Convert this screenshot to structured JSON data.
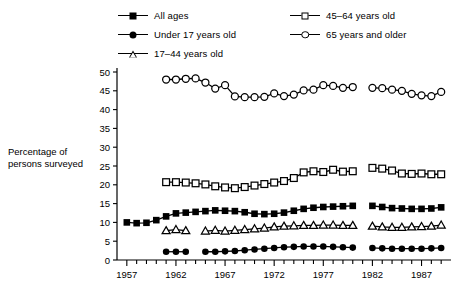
{
  "axis_title": "Percentage of persons surveyed",
  "legend": {
    "left_column": [
      {
        "label": "All ages",
        "marker": "filled-square"
      },
      {
        "label": "Under 17 years old",
        "marker": "filled-circle"
      },
      {
        "label": "17–44 years old",
        "marker": "open-triangle"
      }
    ],
    "right_column": [
      {
        "label": "45–64 years old",
        "marker": "open-square"
      },
      {
        "label": "65 years and older",
        "marker": "open-circle"
      }
    ]
  },
  "chart_data": {
    "type": "line",
    "title": "",
    "xlabel": "",
    "ylabel": "Percentage of persons surveyed",
    "xlim": [
      1956,
      1990
    ],
    "ylim": [
      0,
      50
    ],
    "ytick_step": 5,
    "yticks": [
      0,
      5,
      10,
      15,
      20,
      25,
      30,
      35,
      40,
      45,
      50
    ],
    "xticks_major": [
      1957,
      1962,
      1967,
      1972,
      1977,
      1982,
      1987
    ],
    "xticks_minor_every": 1,
    "grid": false,
    "legend_position": "top",
    "note": "Data gap between 1980 and 1982 for all series except none; all series break at 1981",
    "series": [
      {
        "name": "All ages",
        "marker": "filled-square",
        "x": [
          1957,
          1958,
          1959,
          1960,
          1961,
          1962,
          1963,
          1964,
          1965,
          1966,
          1967,
          1968,
          1969,
          1970,
          1971,
          1972,
          1973,
          1974,
          1975,
          1976,
          1977,
          1978,
          1979,
          1980,
          1982,
          1983,
          1984,
          1985,
          1986,
          1987,
          1988,
          1989
        ],
        "y": [
          10.0,
          9.8,
          9.9,
          10.6,
          11.6,
          12.4,
          12.6,
          12.8,
          13.0,
          13.2,
          13.1,
          13.0,
          12.7,
          12.3,
          12.2,
          12.3,
          12.6,
          13.1,
          13.6,
          13.9,
          14.1,
          14.2,
          14.3,
          14.4,
          14.4,
          14.1,
          13.8,
          13.7,
          13.6,
          13.6,
          13.7,
          14.0
        ]
      },
      {
        "name": "Under 17 years old",
        "marker": "filled-circle",
        "x": [
          1961,
          1962,
          1963,
          1965,
          1966,
          1967,
          1968,
          1969,
          1970,
          1971,
          1972,
          1973,
          1974,
          1975,
          1976,
          1977,
          1978,
          1979,
          1980,
          1982,
          1983,
          1984,
          1985,
          1986,
          1987,
          1988,
          1989
        ],
        "y": [
          2.2,
          2.2,
          2.2,
          2.2,
          2.2,
          2.3,
          2.4,
          2.6,
          2.8,
          3.0,
          3.2,
          3.4,
          3.5,
          3.6,
          3.6,
          3.6,
          3.5,
          3.4,
          3.3,
          3.2,
          3.1,
          3.0,
          3.0,
          3.0,
          3.0,
          3.1,
          3.2
        ]
      },
      {
        "name": "17–44 years old",
        "marker": "open-triangle",
        "x": [
          1961,
          1962,
          1963,
          1965,
          1966,
          1967,
          1968,
          1969,
          1970,
          1971,
          1972,
          1973,
          1974,
          1975,
          1976,
          1977,
          1978,
          1979,
          1980,
          1982,
          1983,
          1984,
          1985,
          1986,
          1987,
          1988,
          1989
        ],
        "y": [
          7.8,
          8.1,
          7.8,
          7.7,
          7.9,
          7.7,
          7.9,
          8.1,
          8.3,
          8.5,
          8.8,
          9.0,
          9.1,
          9.2,
          9.2,
          9.3,
          9.3,
          9.2,
          9.2,
          9.0,
          8.8,
          8.7,
          8.7,
          8.8,
          8.9,
          9.0,
          9.3
        ]
      },
      {
        "name": "45–64 years old",
        "marker": "open-square",
        "x": [
          1961,
          1962,
          1963,
          1964,
          1965,
          1966,
          1967,
          1968,
          1969,
          1970,
          1971,
          1972,
          1973,
          1974,
          1975,
          1976,
          1977,
          1978,
          1979,
          1980,
          1982,
          1983,
          1984,
          1985,
          1986,
          1987,
          1988,
          1989
        ],
        "y": [
          20.7,
          20.7,
          20.6,
          20.4,
          20.1,
          19.6,
          19.3,
          19.1,
          19.4,
          19.8,
          20.2,
          20.6,
          21.0,
          21.8,
          23.3,
          23.6,
          23.4,
          24.0,
          23.5,
          23.6,
          24.5,
          24.3,
          23.8,
          23.0,
          22.9,
          23.0,
          22.8,
          22.8
        ]
      },
      {
        "name": "65 years and older",
        "marker": "open-circle",
        "x": [
          1961,
          1962,
          1963,
          1964,
          1965,
          1966,
          1967,
          1968,
          1969,
          1970,
          1971,
          1972,
          1973,
          1974,
          1975,
          1976,
          1977,
          1978,
          1979,
          1980,
          1982,
          1983,
          1984,
          1985,
          1986,
          1987,
          1988,
          1989
        ],
        "y": [
          48.0,
          48.0,
          48.2,
          48.3,
          47.2,
          45.6,
          46.5,
          43.5,
          43.3,
          43.3,
          43.4,
          44.3,
          43.6,
          44.0,
          45.1,
          45.3,
          46.5,
          46.3,
          45.8,
          46.0,
          45.8,
          45.7,
          45.3,
          45.0,
          44.2,
          43.8,
          43.6,
          44.7
        ]
      }
    ]
  }
}
